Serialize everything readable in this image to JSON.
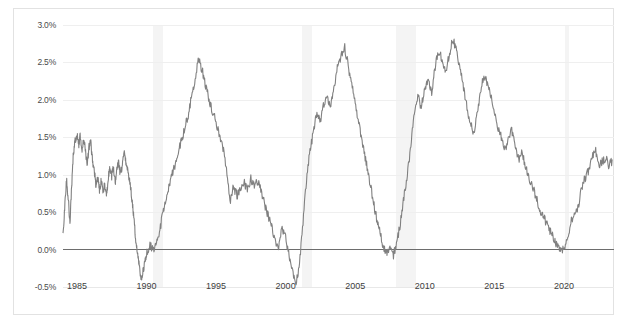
{
  "chart_data": {
    "type": "line",
    "title": "",
    "subtitle": "",
    "xlabel": "",
    "ylabel": "",
    "xlim": [
      1984.0,
      2023.6
    ],
    "ylim": [
      -0.5,
      3.0
    ],
    "y_ticks": [
      "-0.5%",
      "0.0%",
      "0.5%",
      "1.0%",
      "1.5%",
      "2.0%",
      "2.5%",
      "3.0%"
    ],
    "y_tick_values": [
      -0.5,
      0.0,
      0.5,
      1.0,
      1.5,
      2.0,
      2.5,
      3.0
    ],
    "x_ticks": [
      "1985",
      "1990",
      "1995",
      "2000",
      "2005",
      "2010",
      "2015",
      "2020"
    ],
    "x_tick_values": [
      1985,
      1990,
      1995,
      2000,
      2005,
      2010,
      2015,
      2020
    ],
    "grid": true,
    "legend": "none",
    "zero_line": true,
    "zero_line_color": "#6d6d6d",
    "line_color": "#808080",
    "band_color": "#f4f4f4",
    "background_color": "#ffffff",
    "recession_bands": [
      {
        "start": 1990.5,
        "end": 1991.2
      },
      {
        "start": 2001.2,
        "end": 2001.9
      },
      {
        "start": 2007.9,
        "end": 2009.4
      },
      {
        "start": 2020.1,
        "end": 2020.4
      }
    ],
    "series": [
      {
        "name": "spread",
        "x": [
          1984.0,
          1984.12,
          1984.25,
          1984.37,
          1984.5,
          1984.62,
          1984.75,
          1984.87,
          1985.0,
          1985.12,
          1985.25,
          1985.37,
          1985.5,
          1985.62,
          1985.75,
          1985.87,
          1986.0,
          1986.12,
          1986.25,
          1986.37,
          1986.5,
          1986.62,
          1986.75,
          1986.87,
          1987.0,
          1987.12,
          1987.25,
          1987.37,
          1987.5,
          1987.62,
          1987.75,
          1987.87,
          1988.0,
          1988.12,
          1988.25,
          1988.37,
          1988.5,
          1988.62,
          1988.75,
          1988.87,
          1989.0,
          1989.12,
          1989.25,
          1989.37,
          1989.5,
          1989.62,
          1989.75,
          1989.87,
          1990.0,
          1990.25,
          1990.5,
          1990.75,
          1991.0,
          1991.25,
          1991.5,
          1991.75,
          1992.0,
          1992.25,
          1992.5,
          1992.75,
          1993.0,
          1993.25,
          1993.5,
          1993.75,
          1994.0,
          1994.25,
          1994.5,
          1994.75,
          1995.0,
          1995.25,
          1995.5,
          1995.75,
          1996.0,
          1996.25,
          1996.5,
          1996.75,
          1997.0,
          1997.25,
          1997.5,
          1997.75,
          1998.0,
          1998.25,
          1998.5,
          1998.75,
          1999.0,
          1999.25,
          1999.5,
          1999.75,
          2000.0,
          2000.25,
          2000.5,
          2000.75,
          2001.0,
          2001.25,
          2001.5,
          2001.75,
          2002.0,
          2002.25,
          2002.5,
          2002.75,
          2003.0,
          2003.25,
          2003.5,
          2003.75,
          2004.0,
          2004.25,
          2004.5,
          2004.75,
          2005.0,
          2005.25,
          2005.5,
          2005.75,
          2006.0,
          2006.25,
          2006.5,
          2006.75,
          2007.0,
          2007.25,
          2007.5,
          2007.75,
          2008.0,
          2008.25,
          2008.5,
          2008.75,
          2009.0,
          2009.25,
          2009.5,
          2009.75,
          2010.0,
          2010.25,
          2010.5,
          2010.75,
          2011.0,
          2011.25,
          2011.5,
          2011.75,
          2012.0,
          2012.25,
          2012.5,
          2012.75,
          2013.0,
          2013.25,
          2013.5,
          2013.75,
          2014.0,
          2014.25,
          2014.5,
          2014.75,
          2015.0,
          2015.25,
          2015.5,
          2015.75,
          2016.0,
          2016.25,
          2016.5,
          2016.75,
          2017.0,
          2017.25,
          2017.5,
          2017.75,
          2018.0,
          2018.25,
          2018.5,
          2018.75,
          2019.0,
          2019.25,
          2019.5,
          2019.75,
          2020.0,
          2020.25,
          2020.5,
          2020.75,
          2021.0,
          2021.25,
          2021.5,
          2021.75,
          2022.0,
          2022.25,
          2022.5,
          2022.75,
          2023.0,
          2023.25,
          2023.5
        ],
        "y": [
          0.22,
          0.55,
          0.95,
          0.7,
          0.35,
          0.85,
          1.3,
          1.45,
          1.55,
          1.4,
          1.52,
          1.35,
          1.48,
          1.3,
          1.15,
          1.38,
          1.42,
          1.2,
          1.05,
          0.85,
          0.95,
          0.8,
          0.92,
          0.75,
          0.88,
          0.7,
          0.95,
          1.1,
          0.98,
          1.12,
          0.9,
          1.05,
          1.18,
          1.0,
          1.12,
          1.3,
          1.2,
          1.08,
          0.95,
          0.8,
          0.6,
          0.35,
          0.1,
          -0.1,
          -0.25,
          -0.42,
          -0.3,
          -0.15,
          -0.05,
          0.05,
          0.0,
          0.12,
          0.3,
          0.55,
          0.75,
          0.95,
          1.1,
          1.3,
          1.45,
          1.62,
          1.8,
          2.05,
          2.3,
          2.55,
          2.4,
          2.2,
          2.0,
          1.85,
          1.7,
          1.52,
          1.35,
          1.1,
          0.62,
          0.85,
          0.72,
          0.8,
          0.9,
          0.78,
          0.95,
          0.85,
          0.92,
          0.78,
          0.6,
          0.45,
          0.3,
          0.12,
          0.05,
          0.28,
          0.18,
          -0.1,
          -0.3,
          -0.45,
          -0.2,
          0.35,
          0.95,
          1.35,
          1.55,
          1.85,
          1.7,
          1.95,
          2.05,
          1.9,
          2.2,
          2.45,
          2.6,
          2.7,
          2.45,
          2.2,
          1.95,
          1.7,
          1.45,
          1.2,
          0.95,
          0.7,
          0.45,
          0.25,
          0.05,
          -0.05,
          0.02,
          -0.08,
          0.1,
          0.35,
          0.7,
          1.0,
          1.4,
          1.85,
          2.05,
          1.9,
          2.15,
          2.3,
          2.1,
          2.45,
          2.65,
          2.55,
          2.35,
          2.6,
          2.8,
          2.7,
          2.45,
          2.2,
          1.95,
          1.7,
          1.55,
          1.8,
          2.1,
          2.35,
          2.2,
          2.05,
          1.85,
          1.6,
          1.5,
          1.35,
          1.45,
          1.6,
          1.4,
          1.2,
          1.3,
          1.1,
          0.95,
          0.85,
          0.7,
          0.55,
          0.45,
          0.35,
          0.25,
          0.15,
          0.05,
          0.02,
          0.0,
          0.15,
          0.38,
          0.45,
          0.55,
          0.8,
          0.95,
          1.05,
          1.2,
          1.35,
          1.1,
          1.18,
          1.22,
          1.12,
          1.2
        ]
      }
    ]
  },
  "axis": {
    "y_labels": [
      "3.0%",
      "2.5%",
      "2.0%",
      "1.5%",
      "1.0%",
      "0.5%",
      "0.0%",
      "-0.5%"
    ],
    "x_labels": [
      "1985",
      "1990",
      "1995",
      "2000",
      "2005",
      "2010",
      "2015",
      "2020"
    ]
  }
}
